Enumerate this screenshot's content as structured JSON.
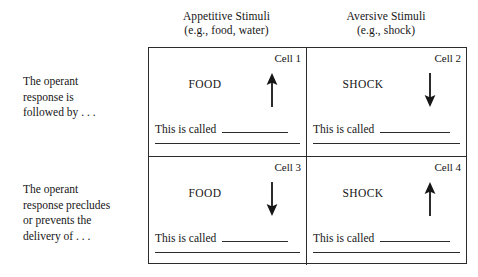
{
  "figure": {
    "line_color": "#2b2b2b",
    "background_color": "#ffffff",
    "text_color": "#161616"
  },
  "columns": [
    {
      "id": "appetitive",
      "heading": "Appetitive Stimuli",
      "subheading": "(e.g., food, water)"
    },
    {
      "id": "aversive",
      "heading": "Aversive Stimuli",
      "subheading": "(e.g., shock)"
    }
  ],
  "rows": [
    {
      "id": "followed-by",
      "label_lines": [
        "The operant",
        "response is",
        "followed by . . ."
      ]
    },
    {
      "id": "precludes",
      "label_lines": [
        "The operant",
        "response precludes",
        "or prevents the",
        "delivery of . . ."
      ]
    }
  ],
  "cells": {
    "cell1": {
      "number": "Cell 1",
      "stimulus": "FOOD",
      "arrow": "arrow-up",
      "arrow_direction": "up",
      "called_text": "This is called",
      "called_answer": ""
    },
    "cell2": {
      "number": "Cell 2",
      "stimulus": "SHOCK",
      "arrow": "arrow-down",
      "arrow_direction": "down",
      "called_text": "This is called",
      "called_answer": ""
    },
    "cell3": {
      "number": "Cell 3",
      "stimulus": "FOOD",
      "arrow": "arrow-down",
      "arrow_direction": "down",
      "called_text": "This is called",
      "called_answer": ""
    },
    "cell4": {
      "number": "Cell 4",
      "stimulus": "SHOCK",
      "arrow": "arrow-up",
      "arrow_direction": "up",
      "called_text": "This is called",
      "called_answer": ""
    }
  }
}
